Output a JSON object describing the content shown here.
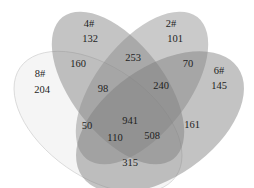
{
  "sets": [
    {
      "name": "8#",
      "fill": "#f2f2f2",
      "opacity": 0.55
    },
    {
      "name": "4#",
      "fill": "#8c8c8c",
      "opacity": 0.55
    },
    {
      "name": "2#",
      "fill": "#9a9a9a",
      "opacity": 0.55
    },
    {
      "name": "6#",
      "fill": "#8a8a8a",
      "opacity": 0.55
    }
  ],
  "labels": {
    "set_8": "8#",
    "set_4": "4#",
    "set_2": "2#",
    "set_6": "6#"
  },
  "regions": {
    "only_8": "204",
    "only_4": "132",
    "only_2": "101",
    "only_6": "145",
    "r_8_4": "160",
    "r_4_2": "253",
    "r_2_6": "70",
    "r_8_6": "315",
    "r_8_4_2": "98",
    "r_4_2_6": "240",
    "r_8_4_6": "110",
    "r_8_2_6": "508",
    "r_8_2": "50",
    "r_4_6": "161",
    "r_all": "941"
  }
}
